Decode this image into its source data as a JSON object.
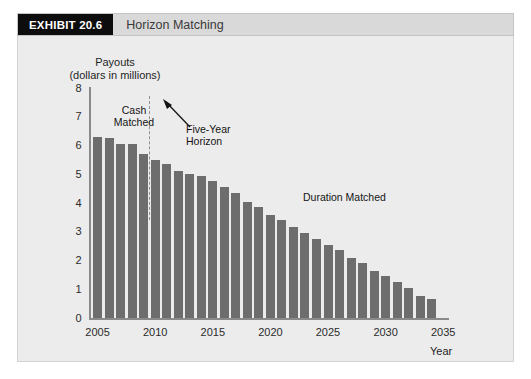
{
  "header": {
    "exhibit_tag": "EXHIBIT 20.6",
    "title": "Horizon Matching"
  },
  "axis_title_line1": "Payouts",
  "axis_title_line2": "(dollars in millions)",
  "x_axis_title": "Year",
  "annotations": {
    "cash_matched": "Cash\nMatched",
    "cash_matched_line1": "Cash",
    "cash_matched_line2": "Matched",
    "five_year_line1": "Five-Year",
    "five_year_line2": "Horizon",
    "duration_matched": "Duration Matched"
  },
  "colors": {
    "bar": "#6d6d6d",
    "panel_background": "#ececec",
    "header_background": "#d9d9d9",
    "exhibit_tag_background": "#0d0d0d",
    "axis": "#8a8a8a",
    "dashed_line": "#909090"
  },
  "chart_data": {
    "type": "bar",
    "title": "Horizon Matching",
    "xlabel": "Year",
    "ylabel": "Payouts (dollars in millions)",
    "ylim": [
      0,
      8
    ],
    "xlim": [
      2004.3,
      2035.5
    ],
    "ytick_labels": [
      "0",
      "1",
      "2",
      "3",
      "4",
      "5",
      "6",
      "7",
      "8"
    ],
    "yticks": [
      0,
      1,
      2,
      3,
      4,
      5,
      6,
      7,
      8
    ],
    "xtick_labels": [
      "2005",
      "2010",
      "2015",
      "2020",
      "2025",
      "2030",
      "2035"
    ],
    "xticks": [
      2005,
      2010,
      2015,
      2020,
      2025,
      2030,
      2035
    ],
    "grid": false,
    "legend": "none",
    "categories": [
      2005,
      2006,
      2007,
      2008,
      2009,
      2010,
      2011,
      2012,
      2013,
      2014,
      2015,
      2016,
      2017,
      2018,
      2019,
      2020,
      2021,
      2022,
      2023,
      2024,
      2025,
      2026,
      2027,
      2028,
      2029,
      2030,
      2031,
      2032,
      2033,
      2034
    ],
    "values": [
      6.3,
      6.25,
      6.05,
      6.05,
      5.7,
      5.5,
      5.35,
      5.1,
      5.0,
      4.95,
      4.75,
      4.55,
      4.35,
      4.05,
      3.85,
      3.6,
      3.4,
      3.15,
      2.95,
      2.75,
      2.55,
      2.35,
      2.1,
      1.9,
      1.65,
      1.45,
      1.25,
      1.05,
      0.75,
      0.65
    ],
    "annotations": [
      {
        "text": "Cash Matched",
        "x": 2007,
        "y": 7.2
      },
      {
        "text": "Five-Year Horizon",
        "x": 2013,
        "y": 6.6
      },
      {
        "text": "Duration Matched",
        "x": 2023,
        "y": 4.3
      }
    ],
    "reference_lines": [
      {
        "type": "vertical",
        "x": 2009.5,
        "style": "dashed",
        "label": "Five-Year Horizon"
      }
    ]
  }
}
